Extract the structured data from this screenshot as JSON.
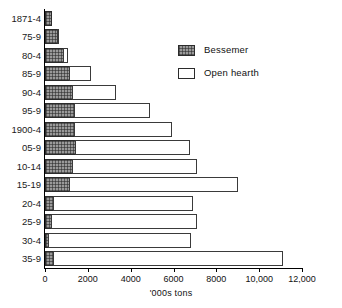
{
  "chart_data": {
    "type": "bar",
    "orientation": "horizontal",
    "title": "",
    "xlabel": "'000s tons",
    "ylabel": "",
    "xlim": [
      0,
      12000
    ],
    "xticks": [
      0,
      2000,
      4000,
      6000,
      8000,
      10000,
      12000
    ],
    "xtick_labels": [
      "0",
      "2000",
      "4000",
      "6000",
      "8000",
      "10,000",
      "12,000"
    ],
    "grid": false,
    "stacked": true,
    "legend_position": "top-right",
    "categories": [
      "1871-4",
      "75-9",
      "80-4",
      "85-9",
      "90-4",
      "95-9",
      "1900-4",
      "05-9",
      "10-14",
      "15-19",
      "20-4",
      "25-9",
      "30-4",
      "35-9"
    ],
    "series": [
      {
        "name": "Bessemer",
        "color": "#9a9a9a",
        "pattern": "hatched",
        "values": [
          330,
          600,
          900,
          1150,
          1300,
          1400,
          1420,
          1450,
          1330,
          1150,
          400,
          330,
          180,
          400
        ]
      },
      {
        "name": "Open hearth",
        "color": "#ffffff",
        "pattern": "solid",
        "values": [
          0,
          60,
          180,
          1000,
          2000,
          3500,
          4500,
          5300,
          5750,
          7850,
          6500,
          6750,
          6650,
          10700
        ]
      }
    ],
    "totals": [
      330,
      660,
      1080,
      2150,
      3300,
      4900,
      5920,
      6750,
      7080,
      9000,
      6900,
      7080,
      6830,
      11100
    ]
  },
  "legend": {
    "items": [
      {
        "label": "Bessemer",
        "swatch": "hatched-square-icon"
      },
      {
        "label": "Open hearth",
        "swatch": "white-square-icon"
      }
    ]
  }
}
